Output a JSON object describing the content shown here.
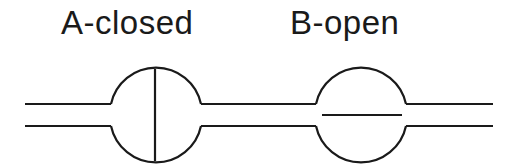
{
  "diagram": {
    "title_a": "A-closed",
    "title_b": "B-open",
    "stroke_color": "#1a1a1a",
    "valves": [
      {
        "id": "A",
        "state": "closed",
        "gate": "vertical"
      },
      {
        "id": "B",
        "state": "open",
        "gate": "horizontal"
      }
    ]
  }
}
